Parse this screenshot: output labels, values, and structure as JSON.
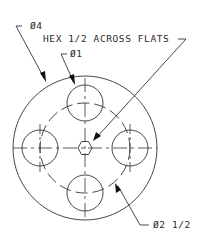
{
  "drawing": {
    "title": "Flange plate with hex center and four holes",
    "labels": {
      "outer_diameter": "Ø4",
      "hex": "HEX 1/2 ACROSS FLATS",
      "hole_diameter": "Ø1",
      "bolt_circle": "Ø2 1/2"
    },
    "colors": {
      "line": "#333333",
      "background": "#ffffff",
      "arrow": "#111111"
    },
    "geometry": {
      "center": [
        85,
        148
      ],
      "outer_radius": 72,
      "bolt_circle_radius": 45,
      "hole_radius": 18,
      "hex_radius": 7
    }
  }
}
